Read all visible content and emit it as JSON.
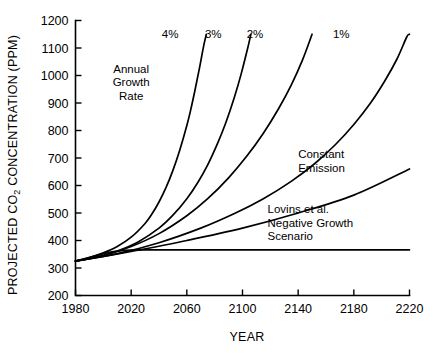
{
  "chart_data": {
    "type": "line",
    "title": "",
    "xlabel": "YEAR",
    "ylabel": "PROJECTED CO2 CONCENTRATION (PPM)",
    "ylabel_main": "PROJECTED CO",
    "ylabel_sub": "2",
    "ylabel_rest": " CONCENTRATION (PPM)",
    "xlim": [
      1980,
      2220
    ],
    "ylim": [
      200,
      1200
    ],
    "xticks": [
      1980,
      2020,
      2060,
      2100,
      2140,
      2180,
      2220
    ],
    "xtick_labels": [
      "1980",
      "2020",
      "2060",
      "2100",
      "2140",
      "2180",
      "2220"
    ],
    "yticks": [
      200,
      300,
      400,
      500,
      600,
      700,
      800,
      900,
      1000,
      1100,
      1200
    ],
    "ytick_labels": [
      "200",
      "300",
      "400",
      "500",
      "600",
      "700",
      "800",
      "900",
      "1000",
      "1100",
      "1200"
    ],
    "grid": false,
    "legend_position": "inline-annotations",
    "start_value": 325,
    "start_year": 1980,
    "annotations": [
      {
        "name": "annual-growth-rate",
        "lines": [
          "Annual",
          "Growth",
          "Rate"
        ],
        "x": 2020,
        "y": 1010
      },
      {
        "name": "constant-emission",
        "lines": [
          "Constant",
          "Emission"
        ],
        "x": 2140,
        "y": 700
      },
      {
        "name": "lovins-scenario",
        "lines": [
          "Lovins et al.",
          "Negative Growth",
          "Scenario"
        ],
        "x": 2118,
        "y": 500
      }
    ],
    "series": [
      {
        "name": "4% annual growth rate",
        "label": "4%",
        "label_x": 2042,
        "label_y": 1150,
        "points": [
          [
            1980,
            325
          ],
          [
            1990,
            338
          ],
          [
            2000,
            355
          ],
          [
            2010,
            378
          ],
          [
            2020,
            412
          ],
          [
            2030,
            462
          ],
          [
            2035,
            497
          ],
          [
            2040,
            540
          ],
          [
            2045,
            592
          ],
          [
            2050,
            655
          ],
          [
            2055,
            730
          ],
          [
            2060,
            818
          ],
          [
            2063,
            880
          ],
          [
            2066,
            950
          ],
          [
            2069,
            1025
          ],
          [
            2072,
            1105
          ],
          [
            2074,
            1150
          ]
        ]
      },
      {
        "name": "3% annual growth rate",
        "label": "3%",
        "label_x": 2073,
        "label_y": 1150,
        "points": [
          [
            1980,
            325
          ],
          [
            1995,
            340
          ],
          [
            2010,
            362
          ],
          [
            2025,
            395
          ],
          [
            2040,
            445
          ],
          [
            2050,
            492
          ],
          [
            2060,
            552
          ],
          [
            2068,
            612
          ],
          [
            2075,
            675
          ],
          [
            2082,
            752
          ],
          [
            2088,
            828
          ],
          [
            2094,
            918
          ],
          [
            2099,
            1005
          ],
          [
            2104,
            1105
          ],
          [
            2106,
            1150
          ]
        ]
      },
      {
        "name": "2% annual growth rate",
        "label": "2%",
        "label_x": 2103,
        "label_y": 1150,
        "points": [
          [
            1980,
            325
          ],
          [
            2000,
            345
          ],
          [
            2020,
            378
          ],
          [
            2040,
            425
          ],
          [
            2060,
            490
          ],
          [
            2075,
            552
          ],
          [
            2090,
            628
          ],
          [
            2103,
            706
          ],
          [
            2115,
            790
          ],
          [
            2126,
            880
          ],
          [
            2135,
            965
          ],
          [
            2143,
            1055
          ],
          [
            2150,
            1150
          ]
        ]
      },
      {
        "name": "1% annual growth rate",
        "label": "1%",
        "label_x": 2165,
        "label_y": 1150,
        "points": [
          [
            1980,
            325
          ],
          [
            2010,
            352
          ],
          [
            2040,
            392
          ],
          [
            2070,
            445
          ],
          [
            2095,
            500
          ],
          [
            2115,
            552
          ],
          [
            2135,
            615
          ],
          [
            2152,
            680
          ],
          [
            2167,
            750
          ],
          [
            2180,
            822
          ],
          [
            2192,
            900
          ],
          [
            2202,
            978
          ],
          [
            2211,
            1060
          ],
          [
            2218,
            1140
          ],
          [
            2220,
            1150
          ]
        ]
      },
      {
        "name": "Constant Emission",
        "label": "",
        "points": [
          [
            1980,
            325
          ],
          [
            2000,
            342
          ],
          [
            2020,
            360
          ],
          [
            2060,
            400
          ],
          [
            2100,
            445
          ],
          [
            2140,
            500
          ],
          [
            2180,
            565
          ],
          [
            2220,
            660
          ]
        ]
      },
      {
        "name": "Lovins et al. Negative Growth Scenario",
        "label": "",
        "points": [
          [
            1980,
            325
          ],
          [
            1995,
            345
          ],
          [
            2005,
            358
          ],
          [
            2015,
            364
          ],
          [
            2030,
            366
          ],
          [
            2060,
            366
          ],
          [
            2120,
            366
          ],
          [
            2180,
            366
          ],
          [
            2220,
            366
          ]
        ]
      }
    ]
  }
}
